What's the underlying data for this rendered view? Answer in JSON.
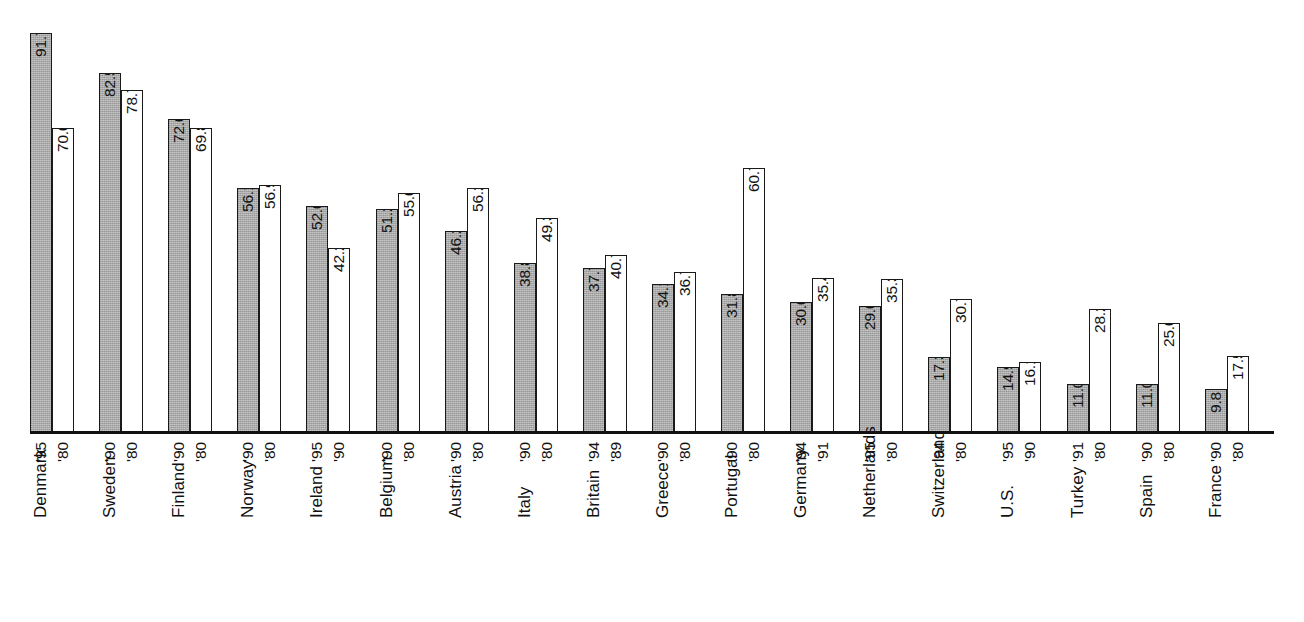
{
  "chart_data": {
    "type": "bar",
    "title": "",
    "subtitle": "",
    "xlabel": "",
    "ylabel": "",
    "ylim": [
      0,
      100
    ],
    "grid": false,
    "legend": "none",
    "orientation": "vertical",
    "value_suffix_first": "%",
    "categories": [
      "Denmark",
      "Sweden",
      "Finland",
      "Norway",
      "Ireland",
      "Belgium",
      "Austria",
      "Italy",
      "Britain",
      "Greece",
      "Portugal",
      "Germany",
      "Netherlands",
      "Switzerland",
      "U.S.",
      "Turkey",
      "Spain",
      "France"
    ],
    "series": [
      {
        "name": "recent-year",
        "style": "gray-filled",
        "color": "#a9a9a9",
        "values": [
          91.7,
          82.5,
          72.0,
          56.1,
          52.0,
          51.2,
          46.2,
          38.8,
          37.7,
          34.1,
          31.8,
          30.0,
          29.0,
          17.3,
          14.9,
          11.0,
          11.0,
          9.8
        ],
        "value_labels": [
          "91.7%",
          "82.5",
          "72.0",
          "56.1",
          "52.0",
          "51.2",
          "46.2",
          "38.8",
          "37.7",
          "34.1",
          "31.8",
          "30.0",
          "29.0",
          "17.3",
          "14.9",
          "11.0",
          "11.0",
          "9.8"
        ],
        "year_labels": [
          "'95",
          "'90",
          "'90",
          "'90",
          "'95",
          "'90",
          "'90",
          "'90",
          "'94",
          "'90",
          "'90",
          "'94",
          "'95",
          "'94",
          "'95",
          "'91",
          "'90",
          "'90"
        ]
      },
      {
        "name": "earlier-year",
        "style": "white-outlined",
        "color": "#ffffff",
        "values": [
          70.0,
          78.7,
          69.8,
          56.9,
          42.2,
          55.0,
          56.2,
          49.3,
          40.7,
          36.7,
          60.7,
          35.4,
          35.3,
          30.7,
          16.1,
          28.2,
          25.0,
          17.5
        ],
        "value_labels": [
          "70.0%",
          "78.7",
          "69.8",
          "56.9",
          "42.2",
          "55.0",
          "56.2",
          "49.3",
          "40.7",
          "36.7",
          "60.7",
          "35.4",
          "35.3",
          "30.7",
          "16.1",
          "28.2",
          "25.0",
          "17.5"
        ],
        "year_labels": [
          "'80",
          "'80",
          "'80",
          "'80",
          "'90",
          "'80",
          "'80",
          "'80",
          "'89",
          "'80",
          "'80",
          "'91",
          "'80",
          "'80",
          "'90",
          "'80",
          "'80",
          "'80"
        ]
      }
    ]
  },
  "style": {
    "bar_fill_gray": "#a9a9a9",
    "bar_fill_white": "#ffffff",
    "bar_outline": "#1a1a1a",
    "text_color": "#111111",
    "background": "#ffffff"
  }
}
